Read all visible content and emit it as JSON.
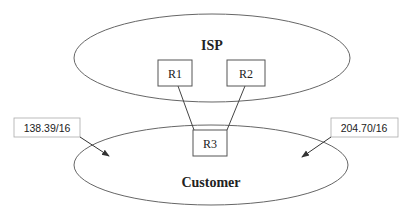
{
  "diagram": {
    "regions": [
      {
        "id": "isp",
        "label": "ISP"
      },
      {
        "id": "customer",
        "label": "Customer"
      }
    ],
    "routers": [
      {
        "id": "r1",
        "label": "R1"
      },
      {
        "id": "r2",
        "label": "R2"
      },
      {
        "id": "r3",
        "label": "R3"
      }
    ],
    "links": [
      {
        "from": "R1",
        "to": "R3"
      },
      {
        "from": "R2",
        "to": "R3"
      }
    ],
    "prefixes": [
      {
        "id": "left",
        "label": "138.39/16"
      },
      {
        "id": "right",
        "label": "204.70/16"
      }
    ],
    "colors": {
      "stroke": "#555555",
      "label_box_stroke": "#aaaaaa",
      "text": "#222222"
    }
  }
}
